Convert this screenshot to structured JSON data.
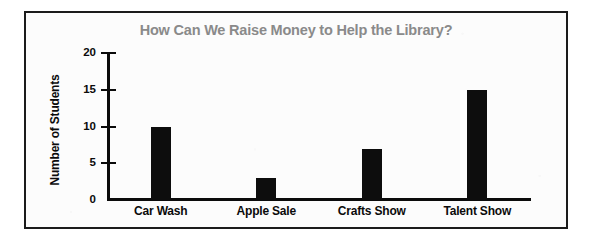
{
  "chart_data": {
    "type": "bar",
    "title": "How Can We Raise Money to Help the Library?",
    "xlabel": "",
    "ylabel": "Number of Students",
    "categories": [
      "Car Wash",
      "Apple Sale",
      "Crafts Show",
      "Talent Show"
    ],
    "values": [
      10,
      3,
      7,
      15
    ],
    "ylim": [
      0,
      20
    ],
    "yticks": [
      "0",
      "5",
      "10",
      "15",
      "20"
    ],
    "ytick_values": [
      0,
      5,
      10,
      15,
      20
    ],
    "grid": false,
    "legend": "none",
    "bar_color": "#0d0d0d",
    "title_color": "#8a8a8a",
    "axis_color": "#0b0b0b"
  }
}
